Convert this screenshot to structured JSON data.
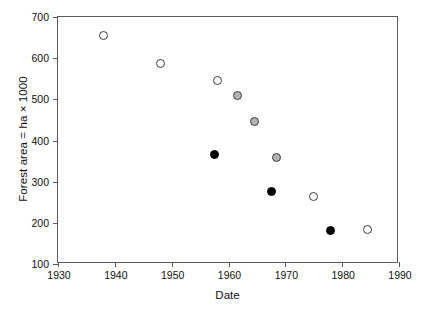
{
  "chart_data": {
    "type": "scatter",
    "title": "",
    "xlabel": "Date",
    "ylabel": "Forest area = ha × 1000",
    "xlim": [
      1930,
      1990
    ],
    "ylim": [
      100,
      700
    ],
    "xticks": [
      1930,
      1940,
      1950,
      1960,
      1970,
      1980,
      1990
    ],
    "yticks": [
      100,
      200,
      300,
      400,
      500,
      600,
      700
    ],
    "grid": false,
    "legend": "none",
    "marker_styles": {
      "open": "#ffffff",
      "grey": "#b3b3b3",
      "black": "#000000",
      "edge": "#3c3c3c"
    },
    "points": [
      {
        "x": 1938,
        "y": 654,
        "style": "open"
      },
      {
        "x": 1948,
        "y": 588,
        "style": "open"
      },
      {
        "x": 1958,
        "y": 546,
        "style": "open"
      },
      {
        "x": 1961.5,
        "y": 510,
        "style": "grey"
      },
      {
        "x": 1964.5,
        "y": 446,
        "style": "grey"
      },
      {
        "x": 1957.5,
        "y": 366,
        "style": "black"
      },
      {
        "x": 1968.5,
        "y": 359,
        "style": "grey"
      },
      {
        "x": 1967.5,
        "y": 276,
        "style": "black"
      },
      {
        "x": 1975,
        "y": 264,
        "style": "open"
      },
      {
        "x": 1978,
        "y": 181,
        "style": "black"
      },
      {
        "x": 1984.5,
        "y": 184,
        "style": "open"
      }
    ]
  }
}
